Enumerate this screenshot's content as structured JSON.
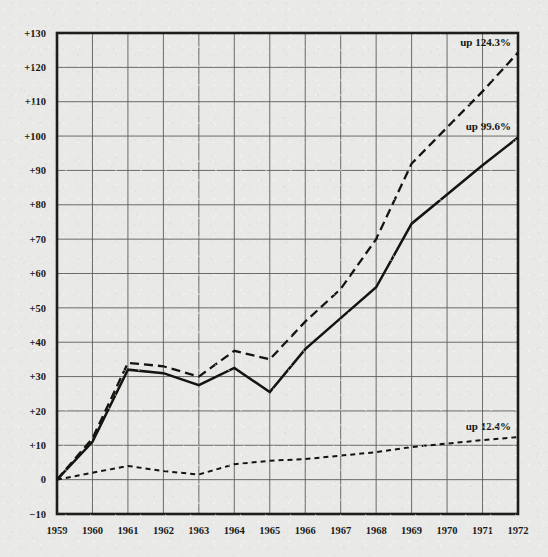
{
  "chart_data": {
    "type": "line",
    "title": "",
    "subtitle": "",
    "xlabel": "",
    "ylabel": "",
    "x": [
      1959,
      1960,
      1961,
      1962,
      1963,
      1964,
      1965,
      1966,
      1967,
      1968,
      1969,
      1970,
      1971,
      1972
    ],
    "xtick_labels": [
      "1959",
      "1960",
      "1961",
      "1962",
      "1963",
      "1964",
      "1965",
      "1966",
      "1967",
      "1968",
      "1969",
      "1970",
      "1971",
      "1972"
    ],
    "xlim": [
      1959,
      1972
    ],
    "ylim": [
      -10,
      130
    ],
    "ytick_values": [
      -10,
      0,
      10,
      20,
      30,
      40,
      50,
      60,
      70,
      80,
      90,
      100,
      110,
      120,
      130
    ],
    "ytick_labels": [
      "−10",
      "0",
      "+10",
      "+20",
      "+30",
      "+40",
      "+50",
      "+60",
      "+70",
      "+80",
      "+90",
      "+100",
      "+110",
      "+120",
      "+130"
    ],
    "grid": true,
    "legend_position": "none",
    "series": [
      {
        "name": "up 124.3%",
        "style": "dashed",
        "end_label": "up 124.3%",
        "values": [
          0,
          12,
          34,
          33,
          30,
          37.5,
          35,
          46,
          55.5,
          70,
          92,
          102.5,
          113,
          124.3
        ]
      },
      {
        "name": "up 99.6%",
        "style": "solid",
        "end_label": "up 99.6%",
        "values": [
          0,
          11,
          32,
          31,
          27.5,
          32.5,
          25.5,
          38,
          47,
          56,
          74.5,
          83,
          91.5,
          99.6
        ]
      },
      {
        "name": "up 12.4%",
        "style": "dotted",
        "end_label": "up 12.4%",
        "values": [
          0,
          2,
          4,
          2.5,
          1.5,
          4.5,
          5.5,
          6,
          7,
          8,
          9.5,
          10.5,
          11.5,
          12.4
        ]
      }
    ],
    "annotations": [
      {
        "text": "up 124.3%",
        "x": 1972,
        "y": 124.3
      },
      {
        "text": "up 99.6%",
        "x": 1972,
        "y": 99.6
      },
      {
        "text": "up 12.4%",
        "x": 1972,
        "y": 12.4
      }
    ],
    "colors": {
      "background": "#e9e9e7",
      "ink": "#15150f",
      "grid": "#5c5c58",
      "frame": "#1d1d1a"
    }
  }
}
